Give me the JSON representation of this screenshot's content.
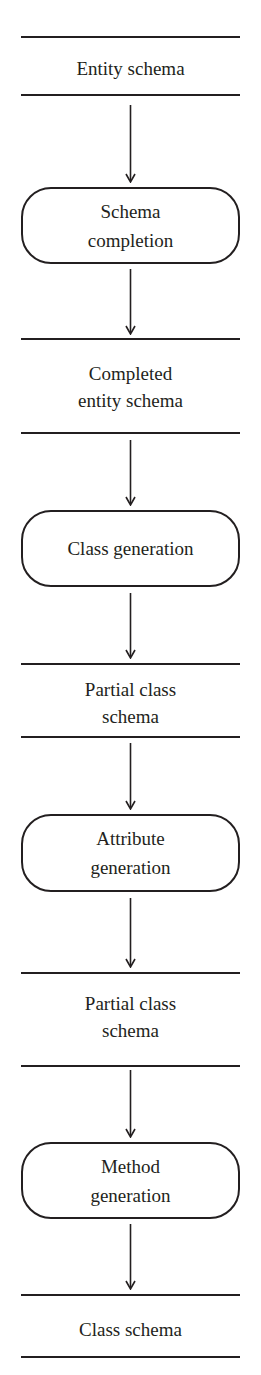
{
  "diagram": {
    "type": "flowchart",
    "direction": "top-to-bottom",
    "nodes": [
      {
        "id": "entity-schema",
        "kind": "data-store",
        "lines": [
          "Entity schema"
        ]
      },
      {
        "id": "schema-completion",
        "kind": "process",
        "lines": [
          "Schema",
          "completion"
        ]
      },
      {
        "id": "completed-entity-schema",
        "kind": "data-store",
        "lines": [
          "Completed",
          "entity schema"
        ]
      },
      {
        "id": "class-generation",
        "kind": "process",
        "lines": [
          "Class generation"
        ]
      },
      {
        "id": "partial-class-schema-1",
        "kind": "data-store",
        "lines": [
          "Partial class",
          "schema"
        ]
      },
      {
        "id": "attribute-generation",
        "kind": "process",
        "lines": [
          "Attribute",
          "generation"
        ]
      },
      {
        "id": "partial-class-schema-2",
        "kind": "data-store",
        "lines": [
          "Partial class",
          "schema"
        ]
      },
      {
        "id": "method-generation",
        "kind": "process",
        "lines": [
          "Method",
          "generation"
        ]
      },
      {
        "id": "class-schema",
        "kind": "data-store",
        "lines": [
          "Class schema"
        ]
      }
    ],
    "edges": [
      {
        "from": "entity-schema",
        "to": "schema-completion"
      },
      {
        "from": "schema-completion",
        "to": "completed-entity-schema"
      },
      {
        "from": "completed-entity-schema",
        "to": "class-generation"
      },
      {
        "from": "class-generation",
        "to": "partial-class-schema-1"
      },
      {
        "from": "partial-class-schema-1",
        "to": "attribute-generation"
      },
      {
        "from": "attribute-generation",
        "to": "partial-class-schema-2"
      },
      {
        "from": "partial-class-schema-2",
        "to": "method-generation"
      },
      {
        "from": "method-generation",
        "to": "class-schema"
      }
    ]
  },
  "colors": {
    "stroke": "#231f20",
    "background": "#ffffff"
  }
}
